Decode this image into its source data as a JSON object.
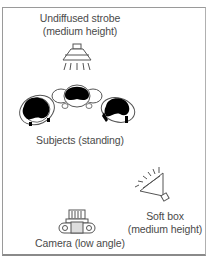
{
  "diagram": {
    "strobe": {
      "label_line1": "Undiffused strobe",
      "label_line2": "(medium height)",
      "icon": "strobe-light-icon"
    },
    "subjects": {
      "label": "Subjects (standing)",
      "count": 3,
      "icon": "person-top-view-icon"
    },
    "softbox": {
      "label_line1": "Soft box",
      "label_line2": "(medium height)",
      "icon": "softbox-light-icon"
    },
    "camera": {
      "label": "Camera (low angle)",
      "icon": "camera-top-view-icon"
    },
    "colors": {
      "line": "#555555",
      "fill_dark": "#000000",
      "fill_light": "#ffffff",
      "frame": "#9a9a9a"
    }
  }
}
